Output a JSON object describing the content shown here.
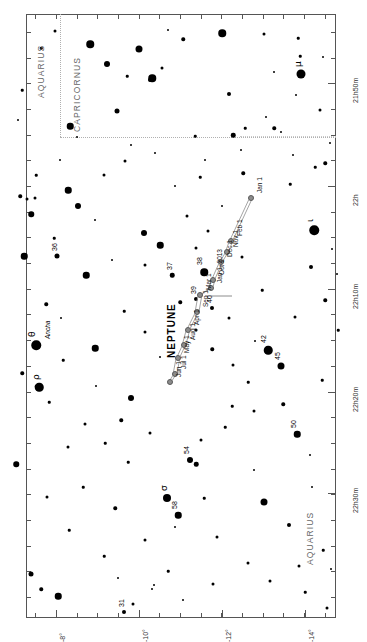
{
  "chart_data": {
    "type": "scatter",
    "xlabel": "Right Ascension",
    "ylabel": "Declination",
    "grid": false,
    "legend": "none",
    "orientation": "rotated-90-ccw",
    "ra_ticks": [
      {
        "label": "21h50m",
        "pos": 0.115
      },
      {
        "label": "22h",
        "pos": 0.285
      },
      {
        "label": "22h10m",
        "pos": 0.455
      },
      {
        "label": "22h20m",
        "pos": 0.625
      },
      {
        "label": "22h30m",
        "pos": 0.793
      }
    ],
    "dec_ticks": [
      {
        "label": "-8°",
        "pos": 0.098
      },
      {
        "label": "-10°",
        "pos": 0.365
      },
      {
        "label": "-12°",
        "pos": 0.632
      },
      {
        "label": "-14°",
        "pos": 0.9
      }
    ],
    "constellations": [
      {
        "name": "AQUARIUS",
        "id": "aquarius-top"
      },
      {
        "name": "CAPRICORNUS",
        "id": "capricornus"
      },
      {
        "name": "AQUARIUS",
        "id": "aquarius-bottom"
      }
    ],
    "planet": {
      "name": "NEPTUNE",
      "path_points": [
        {
          "label": "Jan 1",
          "x": 251,
          "y": 198
        },
        {
          "label": "Feb 1",
          "x": 231,
          "y": 241
        },
        {
          "label": "Nov 1",
          "x": 227,
          "y": 252
        },
        {
          "label": "Dec 1",
          "x": 221,
          "y": 262
        },
        {
          "label": "Oct 1",
          "x": 213,
          "y": 280
        },
        {
          "label": "Jan 1, 2013",
          "x": 211,
          "y": 288
        },
        {
          "label": "Mar 1",
          "x": 200,
          "y": 295
        },
        {
          "label": "Sep 1",
          "x": 197,
          "y": 312
        },
        {
          "label": "Apr 1",
          "x": 188,
          "y": 330
        },
        {
          "label": "Aug 1",
          "x": 184,
          "y": 345
        },
        {
          "label": "May 1",
          "x": 178,
          "y": 358
        },
        {
          "label": "Jul 1",
          "x": 175,
          "y": 374
        },
        {
          "label": "Jun 1",
          "x": 170,
          "y": 382
        }
      ]
    },
    "stars": [
      {
        "x": 301,
        "y": 74,
        "mag": 9.0,
        "label": "μ",
        "kind": "greek"
      },
      {
        "x": 314,
        "y": 230,
        "mag": 9.5,
        "label": "ι",
        "kind": "greek"
      },
      {
        "x": 36,
        "y": 345,
        "mag": 9.5,
        "label": "θ",
        "kind": "greek",
        "name": "Ancha"
      },
      {
        "x": 39,
        "y": 387,
        "mag": 8.5,
        "label": "ρ",
        "kind": "greek"
      },
      {
        "x": 167,
        "y": 498,
        "mag": 8.0,
        "label": "σ",
        "kind": "greek"
      },
      {
        "x": 178,
        "y": 515,
        "mag": 6.5,
        "label": "58",
        "kind": "flam"
      },
      {
        "x": 57,
        "y": 256,
        "mag": 5.0,
        "label": "36",
        "kind": "flam"
      },
      {
        "x": 172,
        "y": 275,
        "mag": 4.5,
        "label": "37",
        "kind": "flam"
      },
      {
        "x": 204,
        "y": 272,
        "mag": 7.5,
        "label": "38",
        "kind": "flam"
      },
      {
        "x": 196,
        "y": 299,
        "mag": 4.0,
        "label": "39",
        "kind": "flam"
      },
      {
        "x": 212,
        "y": 308,
        "mag": 4.0,
        "label": "40",
        "kind": "flam"
      },
      {
        "x": 268,
        "y": 350,
        "mag": 8.5,
        "label": "42",
        "kind": "flam"
      },
      {
        "x": 281,
        "y": 366,
        "mag": 7.0,
        "label": "45",
        "kind": "flam"
      },
      {
        "x": 297,
        "y": 434,
        "mag": 6.5,
        "label": "50",
        "kind": "flam"
      },
      {
        "x": 190,
        "y": 460,
        "mag": 6.0,
        "label": "54",
        "kind": "flam"
      },
      {
        "x": 124,
        "y": 612,
        "mag": 4.0,
        "label": "31",
        "kind": "flam"
      },
      {
        "x": 55,
        "y": 31,
        "mag": 3.0
      },
      {
        "x": 41,
        "y": 48,
        "mag": 2.5
      },
      {
        "x": 90,
        "y": 44,
        "mag": 7.5
      },
      {
        "x": 139,
        "y": 49,
        "mag": 7.0
      },
      {
        "x": 168,
        "y": 30,
        "mag": 2.0
      },
      {
        "x": 107,
        "y": 64,
        "mag": 6.0
      },
      {
        "x": 162,
        "y": 68,
        "mag": 3.0
      },
      {
        "x": 152,
        "y": 78,
        "mag": 7.5
      },
      {
        "x": 150,
        "y": 80,
        "mag": 4.0
      },
      {
        "x": 22,
        "y": 90,
        "mag": 2.5
      },
      {
        "x": 127,
        "y": 76,
        "mag": 2.5
      },
      {
        "x": 117,
        "y": 111,
        "mag": 5.0
      },
      {
        "x": 70,
        "y": 126,
        "mag": 6.5
      },
      {
        "x": 222,
        "y": 33,
        "mag": 7.5
      },
      {
        "x": 264,
        "y": 34,
        "mag": 3.0
      },
      {
        "x": 298,
        "y": 38,
        "mag": 2.5
      },
      {
        "x": 183,
        "y": 39,
        "mag": 3.5
      },
      {
        "x": 300,
        "y": 56,
        "mag": 2.5
      },
      {
        "x": 274,
        "y": 72,
        "mag": 2.0
      },
      {
        "x": 323,
        "y": 57,
        "mag": 2.0
      },
      {
        "x": 274,
        "y": 128,
        "mag": 3.5
      },
      {
        "x": 229,
        "y": 94,
        "mag": 4.0
      },
      {
        "x": 320,
        "y": 110,
        "mag": 3.0
      },
      {
        "x": 330,
        "y": 143,
        "mag": 2.0
      },
      {
        "x": 266,
        "y": 117,
        "mag": 2.0
      },
      {
        "x": 245,
        "y": 128,
        "mag": 2.5
      },
      {
        "x": 281,
        "y": 132,
        "mag": 2.0
      },
      {
        "x": 233,
        "y": 135,
        "mag": 4.5
      },
      {
        "x": 195,
        "y": 136,
        "mag": 2.5
      },
      {
        "x": 77,
        "y": 137,
        "mag": 2.0
      },
      {
        "x": 131,
        "y": 145,
        "mag": 2.0
      },
      {
        "x": 155,
        "y": 153,
        "mag": 2.0
      },
      {
        "x": 293,
        "y": 155,
        "mag": 2.0
      },
      {
        "x": 125,
        "y": 161,
        "mag": 3.0
      },
      {
        "x": 36,
        "y": 175,
        "mag": 2.5
      },
      {
        "x": 104,
        "y": 175,
        "mag": 3.0
      },
      {
        "x": 315,
        "y": 167,
        "mag": 2.5
      },
      {
        "x": 200,
        "y": 177,
        "mag": 2.5
      },
      {
        "x": 68,
        "y": 190,
        "mag": 6.5
      },
      {
        "x": 78,
        "y": 206,
        "mag": 6.0
      },
      {
        "x": 31,
        "y": 214,
        "mag": 5.5
      },
      {
        "x": 20,
        "y": 196,
        "mag": 3.5
      },
      {
        "x": 27,
        "y": 199,
        "mag": 3.0
      },
      {
        "x": 35,
        "y": 198,
        "mag": 3.0
      },
      {
        "x": 54,
        "y": 238,
        "mag": 2.5
      },
      {
        "x": 325,
        "y": 163,
        "mag": 3.5
      },
      {
        "x": 144,
        "y": 233,
        "mag": 6.0
      },
      {
        "x": 160,
        "y": 245,
        "mag": 6.5
      },
      {
        "x": 24,
        "y": 256,
        "mag": 6.5
      },
      {
        "x": 145,
        "y": 265,
        "mag": 3.0
      },
      {
        "x": 46,
        "y": 304,
        "mag": 3.5
      },
      {
        "x": 187,
        "y": 216,
        "mag": 3.0
      },
      {
        "x": 208,
        "y": 231,
        "mag": 3.0
      },
      {
        "x": 196,
        "y": 248,
        "mag": 3.0
      },
      {
        "x": 243,
        "y": 173,
        "mag": 3.5
      },
      {
        "x": 290,
        "y": 184,
        "mag": 2.5
      },
      {
        "x": 262,
        "y": 290,
        "mag": 2.5
      },
      {
        "x": 311,
        "y": 267,
        "mag": 4.0
      },
      {
        "x": 332,
        "y": 249,
        "mag": 2.0
      },
      {
        "x": 325,
        "y": 300,
        "mag": 3.5
      },
      {
        "x": 337,
        "y": 274,
        "mag": 2.0
      },
      {
        "x": 242,
        "y": 257,
        "mag": 3.0
      },
      {
        "x": 180,
        "y": 302,
        "mag": 3.5
      },
      {
        "x": 196,
        "y": 330,
        "mag": 3.0
      },
      {
        "x": 229,
        "y": 318,
        "mag": 3.0
      },
      {
        "x": 212,
        "y": 349,
        "mag": 3.5
      },
      {
        "x": 86,
        "y": 275,
        "mag": 6.5
      },
      {
        "x": 124,
        "y": 311,
        "mag": 2.5
      },
      {
        "x": 145,
        "y": 332,
        "mag": 3.0
      },
      {
        "x": 95,
        "y": 348,
        "mag": 6.5
      },
      {
        "x": 63,
        "y": 360,
        "mag": 2.5
      },
      {
        "x": 22,
        "y": 373,
        "mag": 3.5
      },
      {
        "x": 131,
        "y": 398,
        "mag": 6.0
      },
      {
        "x": 36,
        "y": 386,
        "mag": 2.5
      },
      {
        "x": 49,
        "y": 402,
        "mag": 2.5
      },
      {
        "x": 16,
        "y": 464,
        "mag": 5.5
      },
      {
        "x": 85,
        "y": 424,
        "mag": 3.0
      },
      {
        "x": 105,
        "y": 443,
        "mag": 2.5
      },
      {
        "x": 121,
        "y": 420,
        "mag": 3.5
      },
      {
        "x": 128,
        "y": 462,
        "mag": 2.5
      },
      {
        "x": 68,
        "y": 447,
        "mag": 3.0
      },
      {
        "x": 150,
        "y": 433,
        "mag": 3.0
      },
      {
        "x": 201,
        "y": 440,
        "mag": 3.0
      },
      {
        "x": 196,
        "y": 464,
        "mag": 4.5
      },
      {
        "x": 225,
        "y": 427,
        "mag": 2.5
      },
      {
        "x": 232,
        "y": 406,
        "mag": 2.5
      },
      {
        "x": 254,
        "y": 411,
        "mag": 3.0
      },
      {
        "x": 248,
        "y": 382,
        "mag": 2.5
      },
      {
        "x": 283,
        "y": 404,
        "mag": 3.5
      },
      {
        "x": 233,
        "y": 365,
        "mag": 3.0
      },
      {
        "x": 295,
        "y": 317,
        "mag": 3.0
      },
      {
        "x": 338,
        "y": 330,
        "mag": 2.5
      },
      {
        "x": 322,
        "y": 380,
        "mag": 2.5
      },
      {
        "x": 47,
        "y": 497,
        "mag": 3.0
      },
      {
        "x": 83,
        "y": 487,
        "mag": 2.5
      },
      {
        "x": 115,
        "y": 508,
        "mag": 3.5
      },
      {
        "x": 69,
        "y": 530,
        "mag": 2.5
      },
      {
        "x": 145,
        "y": 540,
        "mag": 3.0
      },
      {
        "x": 104,
        "y": 556,
        "mag": 2.5
      },
      {
        "x": 168,
        "y": 571,
        "mag": 2.5
      },
      {
        "x": 204,
        "y": 498,
        "mag": 2.5
      },
      {
        "x": 217,
        "y": 537,
        "mag": 3.0
      },
      {
        "x": 264,
        "y": 502,
        "mag": 7.0
      },
      {
        "x": 248,
        "y": 563,
        "mag": 3.0
      },
      {
        "x": 289,
        "y": 525,
        "mag": 4.0
      },
      {
        "x": 299,
        "y": 566,
        "mag": 3.0
      },
      {
        "x": 323,
        "y": 550,
        "mag": 2.5
      },
      {
        "x": 312,
        "y": 487,
        "mag": 2.0
      },
      {
        "x": 31,
        "y": 574,
        "mag": 5.0
      },
      {
        "x": 41,
        "y": 589,
        "mag": 3.5
      },
      {
        "x": 58,
        "y": 596,
        "mag": 6.5
      },
      {
        "x": 133,
        "y": 604,
        "mag": 3.0
      },
      {
        "x": 154,
        "y": 585,
        "mag": 2.0
      },
      {
        "x": 152,
        "y": 589,
        "mag": 2.0
      },
      {
        "x": 213,
        "y": 584,
        "mag": 3.0
      },
      {
        "x": 270,
        "y": 581,
        "mag": 3.0
      },
      {
        "x": 305,
        "y": 592,
        "mag": 2.5
      },
      {
        "x": 327,
        "y": 608,
        "mag": 3.0
      },
      {
        "x": 331,
        "y": 569,
        "mag": 2.0
      },
      {
        "x": 183,
        "y": 600,
        "mag": 2.0
      },
      {
        "x": 95,
        "y": 220,
        "mag": 2.0
      },
      {
        "x": 112,
        "y": 260,
        "mag": 2.0
      },
      {
        "x": 175,
        "y": 186,
        "mag": 2.0
      },
      {
        "x": 222,
        "y": 206,
        "mag": 2.0
      },
      {
        "x": 241,
        "y": 150,
        "mag": 2.0
      },
      {
        "x": 296,
        "y": 95,
        "mag": 2.0
      },
      {
        "x": 60,
        "y": 160,
        "mag": 2.0
      },
      {
        "x": 18,
        "y": 120,
        "mag": 2.0
      },
      {
        "x": 205,
        "y": 160,
        "mag": 2.0
      },
      {
        "x": 254,
        "y": 470,
        "mag": 2.0
      },
      {
        "x": 310,
        "y": 455,
        "mag": 2.0
      },
      {
        "x": 175,
        "y": 527,
        "mag": 2.0
      },
      {
        "x": 61,
        "y": 318,
        "mag": 2.0
      },
      {
        "x": 160,
        "y": 357,
        "mag": 2.0
      },
      {
        "x": 96,
        "y": 386,
        "mag": 2.0
      },
      {
        "x": 255,
        "y": 341,
        "mag": 2.0
      },
      {
        "x": 118,
        "y": 578,
        "mag": 2.0
      }
    ]
  }
}
